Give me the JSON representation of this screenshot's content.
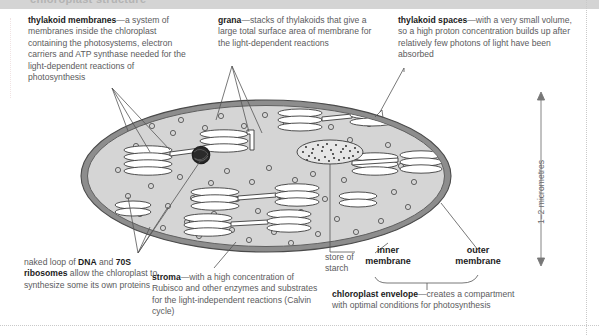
{
  "header_band": {
    "cutoff_text": "chloroplast structure"
  },
  "notes": {
    "thylakoid_membranes": {
      "term": "thylakoid membranes",
      "body": "—a system of membranes inside the chloroplast containing the photosystems, electron carriers and ATP synthase needed for the light-dependent reactions of photosynthesis"
    },
    "grana": {
      "term": "grana",
      "body": "—stacks of thylakoids that give a large total surface area of membrane for the  light-dependent reactions"
    },
    "thylakoid_spaces": {
      "term": "thylakoid spaces",
      "body": "—with a very small volume, so a high proton concentration builds up after relatively few photons of light have been absorbed"
    },
    "dna_ribosomes": {
      "pre": "naked loop of ",
      "term1": "DNA",
      "mid": " and ",
      "term2": "70S ribosomes",
      "body": " allow the chloroplast to synthesize some its own proteins"
    },
    "stroma": {
      "term": "stroma",
      "body": "—with a high concentration of Rubisco and other enzymes and substrates for the light-independent reactions (Calvin cycle)"
    },
    "chloroplast_envelope": {
      "term": "chloroplast envelope",
      "body": "—creates a compartment with optimal conditions for photosynthesis"
    }
  },
  "labels": {
    "store_of_starch_line1": "store of",
    "store_of_starch_line2": "starch",
    "inner_membrane_line1": "inner",
    "inner_membrane_line2": "membrane",
    "outer_membrane_line1": "outer",
    "outer_membrane_line2": "membrane"
  },
  "scale": {
    "caption": "1–2 micrometres"
  },
  "colors": {
    "stroma_fill": "#d5d5d5",
    "envelope_outer": "#6b6b6b",
    "envelope_inner": "#9a9a9a",
    "text_body": "#5b5b5d",
    "text_term": "#1b1b1b",
    "band": "#d4d4d4",
    "leader": "#555555",
    "dna_blob": "#2a2a2a"
  },
  "diagram": {
    "name": "chloroplast-cross-section",
    "ellipse": {
      "cx": 266,
      "cy": 176,
      "rx": 185,
      "ry": 76
    },
    "starch_grain": {
      "cx": 330,
      "cy": 152,
      "rx": 33,
      "ry": 12
    },
    "dna_loop": {
      "cx": 201,
      "cy": 155,
      "r": 9
    },
    "grana_count": 11,
    "ribosome_count": 52
  }
}
